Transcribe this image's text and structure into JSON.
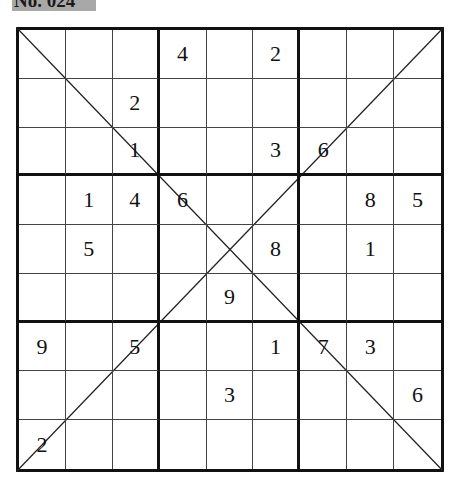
{
  "puzzle": {
    "label": "No. 024",
    "type": "diagonal-sudoku",
    "grid": [
      [
        "",
        "",
        "",
        "4",
        "",
        "2",
        "",
        "",
        ""
      ],
      [
        "",
        "",
        "2",
        "",
        "",
        "",
        "",
        "",
        ""
      ],
      [
        "",
        "",
        "1",
        "",
        "",
        "3",
        "6",
        "",
        ""
      ],
      [
        "",
        "1",
        "4",
        "6",
        "",
        "",
        "",
        "8",
        "5"
      ],
      [
        "",
        "5",
        "",
        "",
        "",
        "8",
        "",
        "1",
        ""
      ],
      [
        "",
        "",
        "",
        "",
        "9",
        "",
        "",
        "",
        ""
      ],
      [
        "9",
        "",
        "5",
        "",
        "",
        "1",
        "7",
        "3",
        ""
      ],
      [
        "",
        "",
        "",
        "",
        "3",
        "",
        "",
        "",
        "6"
      ],
      [
        "2",
        "",
        "",
        "",
        "",
        "",
        "",
        "",
        ""
      ]
    ]
  },
  "colors": {
    "label_bg": "#a8a8a8",
    "grid_line": "#111111",
    "digit": "#111111"
  }
}
